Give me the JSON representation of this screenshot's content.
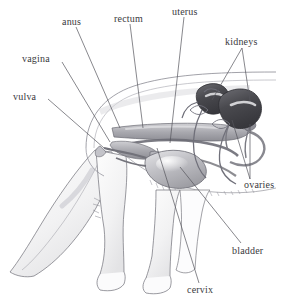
{
  "figure": {
    "style": "pencil-sketch anatomical illustration",
    "background_color": "#ffffff",
    "ink_color": "#3a3a40",
    "organ_fill_light": "#c9c9cd",
    "organ_fill_mid": "#9a9aa0",
    "organ_fill_dark": "#4a4a4f",
    "leader_line_color": "#55555c"
  },
  "labels": [
    {
      "id": "vulva",
      "text": "vulva",
      "x": 13,
      "y": 92,
      "anchor_x": 48,
      "anchor_y": 99,
      "targets": [
        [
          104,
          148
        ]
      ]
    },
    {
      "id": "vagina",
      "text": "vagina",
      "x": 22,
      "y": 54,
      "anchor_x": 62,
      "anchor_y": 62,
      "targets": [
        [
          110,
          142
        ]
      ]
    },
    {
      "id": "anus",
      "text": "anus",
      "x": 62,
      "y": 17,
      "anchor_x": 76,
      "anchor_y": 27,
      "targets": [
        [
          120,
          128
        ]
      ]
    },
    {
      "id": "rectum",
      "text": "rectum",
      "x": 114,
      "y": 14,
      "anchor_x": 130,
      "anchor_y": 24,
      "targets": [
        [
          143,
          128
        ]
      ]
    },
    {
      "id": "uterus",
      "text": "uterus",
      "x": 172,
      "y": 7,
      "anchor_x": 184,
      "anchor_y": 17,
      "targets": [
        [
          170,
          143
        ]
      ]
    },
    {
      "id": "kidneys",
      "text": "kidneys",
      "x": 225,
      "y": 37,
      "anchor_x": 242,
      "anchor_y": 48,
      "targets": [
        [
          212,
          100
        ],
        [
          250,
          101
        ]
      ]
    },
    {
      "id": "ovaries",
      "text": "ovaries",
      "x": 244,
      "y": 180,
      "anchor_x": 250,
      "anchor_y": 179,
      "targets": [
        [
          232,
          120
        ],
        [
          250,
          124
        ]
      ]
    },
    {
      "id": "bladder",
      "text": "bladder",
      "x": 232,
      "y": 246,
      "anchor_x": 241,
      "anchor_y": 243,
      "targets": [
        [
          180,
          167
        ]
      ]
    },
    {
      "id": "cervix",
      "text": "cervix",
      "x": 187,
      "y": 285,
      "anchor_x": 199,
      "anchor_y": 283,
      "targets": [
        [
          157,
          148
        ]
      ]
    }
  ],
  "organs": [
    {
      "id": "left-kidney",
      "name": "kidney-left",
      "shape": "bean"
    },
    {
      "id": "right-kidney",
      "name": "kidney-right",
      "shape": "bean"
    },
    {
      "id": "bladder-sac",
      "name": "bladder",
      "shape": "rounded-sac"
    },
    {
      "id": "uterine-horns",
      "name": "uterine-horns",
      "shape": "paired-tubes"
    },
    {
      "id": "rectum-tube",
      "name": "rectum",
      "shape": "tube"
    },
    {
      "id": "ovary-left",
      "name": "ovary-left",
      "shape": "small-oval"
    },
    {
      "id": "ovary-right",
      "name": "ovary-right",
      "shape": "small-oval"
    }
  ],
  "animal_parts": [
    {
      "id": "tail",
      "name": "cat-tail"
    },
    {
      "id": "hind-leg",
      "name": "cat-hind-leg"
    },
    {
      "id": "front-leg",
      "name": "cat-front-leg"
    },
    {
      "id": "back-line",
      "name": "cat-back-outline"
    },
    {
      "id": "belly-line",
      "name": "cat-belly-outline"
    }
  ]
}
